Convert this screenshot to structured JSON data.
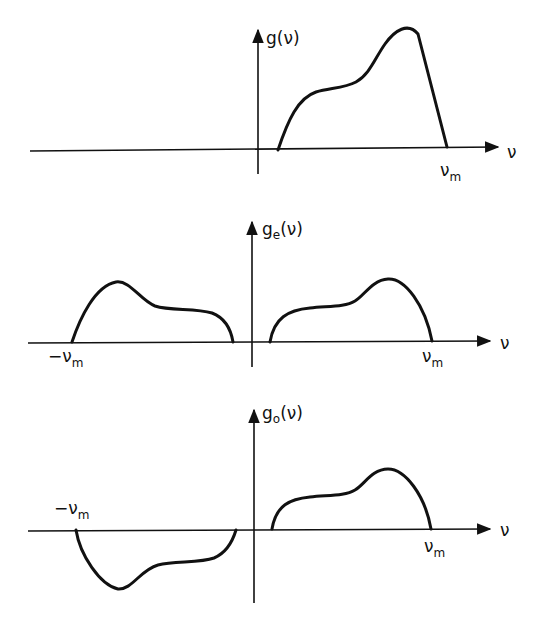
{
  "figure": {
    "panels": [
      {
        "id": "original",
        "y_label": "g(ν)",
        "x_label": "ν",
        "tick_labels": [
          "ν_m"
        ],
        "description": "Spectrum g(ν) nonzero only for positive ν up to ν_m"
      },
      {
        "id": "even",
        "y_label_base": "g",
        "y_label_sub": "e",
        "y_label_tail": "(ν)",
        "x_label": "ν",
        "tick_labels": [
          "−ν_m",
          "ν_m"
        ],
        "description": "Even part g_e(ν): symmetric half-amplitude copies on both sides"
      },
      {
        "id": "odd",
        "y_label_base": "g",
        "y_label_sub": "o",
        "y_label_tail": "(ν)",
        "x_label": "ν",
        "tick_labels": [
          "−ν_m",
          "ν_m"
        ],
        "description": "Odd part g_o(ν): antisymmetric half-amplitude copies"
      }
    ]
  },
  "labels": {
    "p1_y": "g(ν)",
    "p1_x": "ν",
    "p1_vm_base": "ν",
    "p1_vm_sub": "m",
    "p2_y_base": "g",
    "p2_y_sub": "e",
    "p2_y_tail": "(ν)",
    "p2_x": "ν",
    "p2_neg_base": "−ν",
    "p2_neg_sub": "m",
    "p2_pos_base": "ν",
    "p2_pos_sub": "m",
    "p3_y_base": "g",
    "p3_y_sub": "o",
    "p3_y_tail": "(ν)",
    "p3_x": "ν",
    "p3_neg_base": "−ν",
    "p3_neg_sub": "m",
    "p3_pos_base": "ν",
    "p3_pos_sub": "m"
  }
}
